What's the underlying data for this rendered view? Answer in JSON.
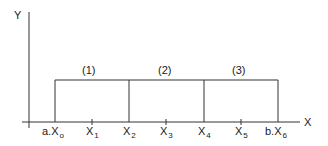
{
  "axes": {
    "x_label": "X",
    "y_label": "Y"
  },
  "intervals": [
    {
      "label": "(1)",
      "from": "x0",
      "to": "x2"
    },
    {
      "label": "(2)",
      "from": "x2",
      "to": "x4"
    },
    {
      "label": "(3)",
      "from": "x4",
      "to": "x6"
    }
  ],
  "ticks": [
    {
      "prefix": "a.",
      "base": "X",
      "sub": "o"
    },
    {
      "prefix": "",
      "base": "X",
      "sub": "1"
    },
    {
      "prefix": "",
      "base": "X",
      "sub": "2"
    },
    {
      "prefix": "",
      "base": "X",
      "sub": "3"
    },
    {
      "prefix": "",
      "base": "X",
      "sub": "4"
    },
    {
      "prefix": "",
      "base": "X",
      "sub": "5"
    },
    {
      "prefix": "b.",
      "base": "X",
      "sub": "6"
    }
  ],
  "colors": {
    "line": "#333333",
    "background": "#ffffff"
  }
}
